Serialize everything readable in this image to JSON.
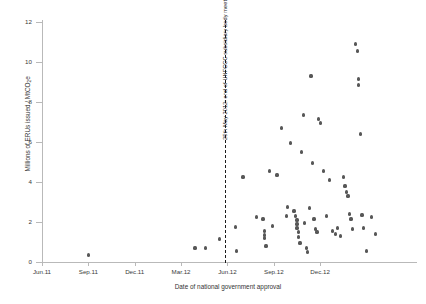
{
  "chart_data": {
    "type": "scatter",
    "title": "",
    "subtitle": "",
    "xlabel": "Date of national government approval",
    "ylabel": "Millions of ERUs issued / MtCO",
    "ylabel_sub": "2",
    "ylabel_suffix": "e",
    "ylim": [
      0,
      12
    ],
    "yticks": [
      0,
      2,
      4,
      6,
      8,
      10,
      12
    ],
    "ytick_labels": [
      "0",
      "2",
      "4",
      "6",
      "8",
      "10",
      "12"
    ],
    "xlim": [
      "Jun.11",
      "Feb.13"
    ],
    "xticks": [
      "Jun.11",
      "Sep.11",
      "Dec.11",
      "Mar.12",
      "Jun.12",
      "Sep.12",
      "Dec.12"
    ],
    "xtick_labels": [
      "Jun.11",
      "Sep.11",
      "Dec.11",
      "Mar.12",
      "Jun.12",
      "Sep.12",
      "Dec.12"
    ],
    "grid": false,
    "legend": "none",
    "marker_color": "#575757",
    "annotations": [
      {
        "type": "vline",
        "label": "25th May 2012: end of UNFCCC subsidiary body meeting",
        "x": "2012-05-25",
        "style": "dashed",
        "color": "#1d1d1d"
      }
    ],
    "x_units": "months since Jun 2011",
    "points": [
      {
        "x": 3.0,
        "y": 0.35
      },
      {
        "x": 9.9,
        "y": 0.7
      },
      {
        "x": 10.6,
        "y": 0.7
      },
      {
        "x": 11.5,
        "y": 1.15
      },
      {
        "x": 12.5,
        "y": 1.75
      },
      {
        "x": 12.6,
        "y": 0.55
      },
      {
        "x": 13.0,
        "y": 4.25
      },
      {
        "x": 13.9,
        "y": 2.25
      },
      {
        "x": 14.3,
        "y": 2.15
      },
      {
        "x": 14.4,
        "y": 1.55
      },
      {
        "x": 14.4,
        "y": 1.35
      },
      {
        "x": 14.4,
        "y": 1.2
      },
      {
        "x": 14.5,
        "y": 0.8
      },
      {
        "x": 14.7,
        "y": 4.55
      },
      {
        "x": 14.9,
        "y": 1.8
      },
      {
        "x": 15.2,
        "y": 4.35
      },
      {
        "x": 15.5,
        "y": 6.7
      },
      {
        "x": 15.8,
        "y": 2.3
      },
      {
        "x": 15.9,
        "y": 2.75
      },
      {
        "x": 16.1,
        "y": 5.95
      },
      {
        "x": 16.3,
        "y": 2.55
      },
      {
        "x": 16.4,
        "y": 2.3
      },
      {
        "x": 16.5,
        "y": 2.1
      },
      {
        "x": 16.5,
        "y": 1.9
      },
      {
        "x": 16.5,
        "y": 1.7
      },
      {
        "x": 16.6,
        "y": 1.5
      },
      {
        "x": 16.6,
        "y": 1.25
      },
      {
        "x": 16.7,
        "y": 0.95
      },
      {
        "x": 16.8,
        "y": 5.5
      },
      {
        "x": 16.9,
        "y": 7.35
      },
      {
        "x": 17.0,
        "y": 1.95
      },
      {
        "x": 17.1,
        "y": 0.7
      },
      {
        "x": 17.2,
        "y": 0.5
      },
      {
        "x": 17.3,
        "y": 2.7
      },
      {
        "x": 17.4,
        "y": 9.3
      },
      {
        "x": 17.5,
        "y": 4.95
      },
      {
        "x": 17.6,
        "y": 2.15
      },
      {
        "x": 17.7,
        "y": 1.65
      },
      {
        "x": 17.8,
        "y": 1.5
      },
      {
        "x": 17.9,
        "y": 7.15
      },
      {
        "x": 18.0,
        "y": 6.95
      },
      {
        "x": 18.2,
        "y": 4.55
      },
      {
        "x": 18.4,
        "y": 2.3
      },
      {
        "x": 18.6,
        "y": 4.1
      },
      {
        "x": 18.8,
        "y": 1.55
      },
      {
        "x": 19.0,
        "y": 1.4
      },
      {
        "x": 19.1,
        "y": 1.7
      },
      {
        "x": 19.3,
        "y": 1.3
      },
      {
        "x": 19.5,
        "y": 4.25
      },
      {
        "x": 19.6,
        "y": 3.8
      },
      {
        "x": 19.7,
        "y": 3.5
      },
      {
        "x": 19.8,
        "y": 3.3
      },
      {
        "x": 19.9,
        "y": 2.4
      },
      {
        "x": 20.0,
        "y": 2.15
      },
      {
        "x": 20.1,
        "y": 1.65
      },
      {
        "x": 20.3,
        "y": 10.9
      },
      {
        "x": 20.4,
        "y": 10.55
      },
      {
        "x": 20.5,
        "y": 9.15
      },
      {
        "x": 20.5,
        "y": 8.85
      },
      {
        "x": 20.6,
        "y": 6.4
      },
      {
        "x": 20.7,
        "y": 2.35
      },
      {
        "x": 20.8,
        "y": 1.7
      },
      {
        "x": 21.0,
        "y": 0.55
      },
      {
        "x": 21.3,
        "y": 2.25
      },
      {
        "x": 21.6,
        "y": 1.4
      }
    ]
  }
}
